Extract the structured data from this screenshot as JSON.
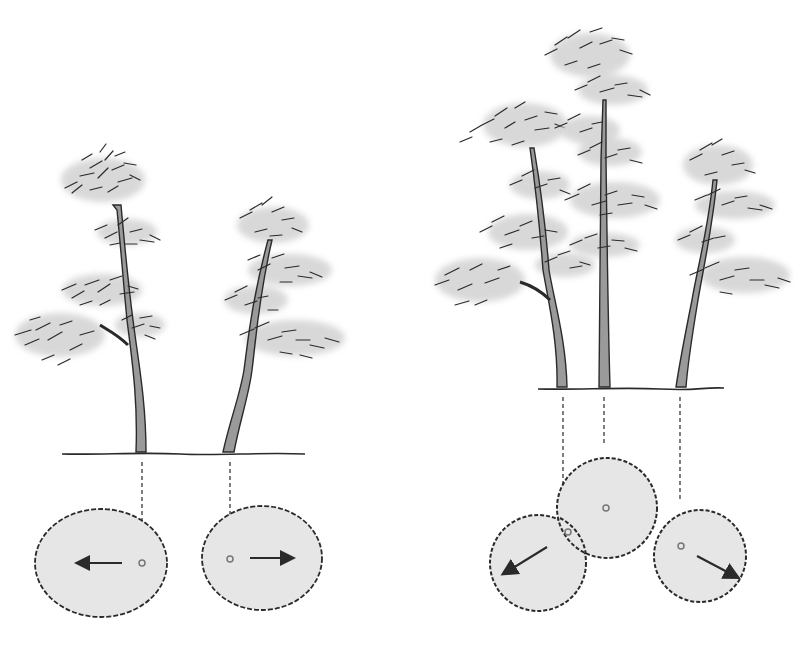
{
  "figure": {
    "colors": {
      "background": "#ffffff",
      "ink": "#2a2a2a",
      "foliage_shade": "#cfcfcf",
      "footprint_fill": "#e6e6e6",
      "trunk_fill": "#9a9a9a"
    }
  },
  "groups": [
    {
      "name": "two-tree-planting",
      "ground": {
        "x1": 62,
        "x2": 305,
        "y": 454
      },
      "trees": [
        {
          "trunk_base_x": 141,
          "top_y": 150,
          "lean": "left"
        },
        {
          "trunk_base_x": 228,
          "top_y": 203,
          "lean": "right"
        }
      ],
      "footprints": [
        {
          "cx": 101,
          "cy": 563,
          "rx": 66,
          "ry": 54,
          "center_x": 142,
          "center_y": 563,
          "arrow": {
            "x1": 122,
            "y1": 563,
            "x2": 78,
            "y2": 563
          }
        },
        {
          "cx": 262,
          "cy": 558,
          "rx": 60,
          "ry": 52,
          "center_x": 230,
          "center_y": 559,
          "arrow": {
            "x1": 250,
            "y1": 558,
            "x2": 292,
            "y2": 558
          }
        }
      ]
    },
    {
      "name": "three-tree-planting",
      "ground": {
        "x1": 538,
        "x2": 724,
        "y": 389
      },
      "trees": [
        {
          "trunk_base_x": 562,
          "top_y": 88,
          "lean": "left"
        },
        {
          "trunk_base_x": 604,
          "top_y": 27,
          "lean": "none"
        },
        {
          "trunk_base_x": 681,
          "top_y": 142,
          "lean": "right"
        }
      ],
      "footprints": [
        {
          "cx": 538,
          "cy": 563,
          "r": 48,
          "center_x": 568,
          "center_y": 532,
          "arrow": {
            "x1": 547,
            "y1": 547,
            "x2": 503,
            "y2": 574
          }
        },
        {
          "cx": 607,
          "cy": 508,
          "r": 50,
          "center_x": 606,
          "center_y": 508,
          "arrow": null
        },
        {
          "cx": 700,
          "cy": 556,
          "r": 46,
          "center_x": 681,
          "center_y": 546,
          "arrow": {
            "x1": 697,
            "y1": 556,
            "x2": 737,
            "y2": 577
          }
        }
      ]
    }
  ]
}
